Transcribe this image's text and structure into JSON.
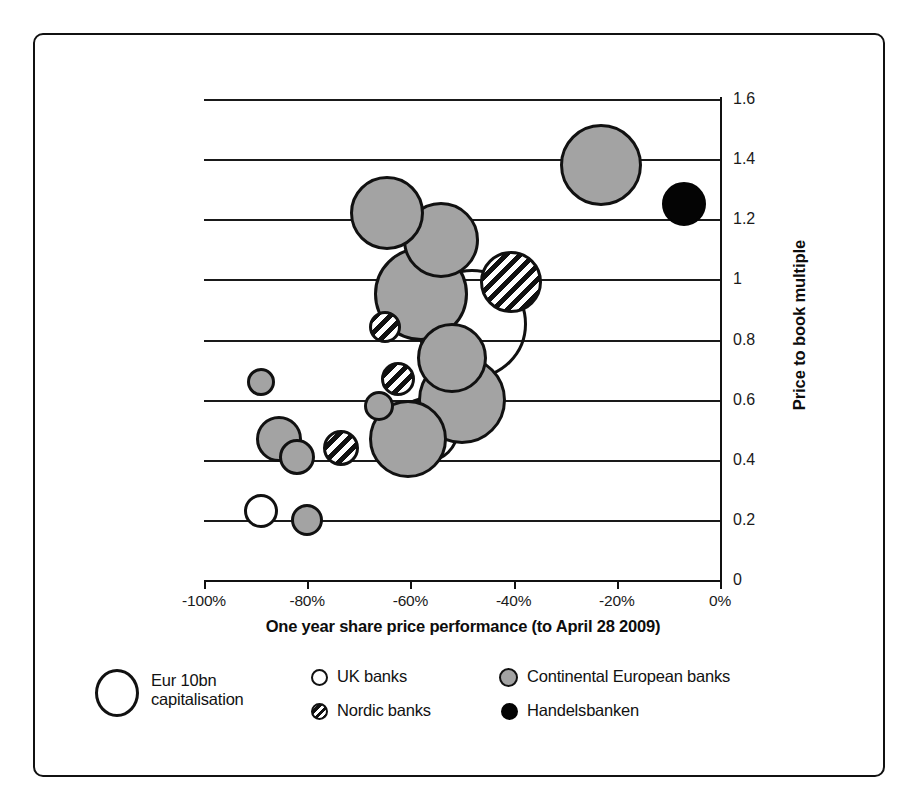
{
  "chart_data": {
    "type": "scatter",
    "title": "",
    "xlabel": "One year share price performance (to April 28 2009)",
    "ylabel": "Price to book multiple",
    "xlim": [
      -100,
      0
    ],
    "ylim": [
      0,
      1.6
    ],
    "xticks": [
      "-100%",
      "-80%",
      "-60%",
      "-40%",
      "-20%",
      "0%"
    ],
    "xtick_values": [
      -100,
      -80,
      -60,
      -40,
      -20,
      0
    ],
    "yticks": [
      "0",
      "0.2",
      "0.4",
      "0.6",
      "0.8",
      "1",
      "1.2",
      "1.4",
      "1.6"
    ],
    "ytick_values": [
      0,
      0.2,
      0.4,
      0.6,
      0.8,
      1,
      1.2,
      1.4,
      1.6
    ],
    "grid": "horizontal",
    "size_meaning": "bubble area proportional to market capitalisation",
    "series": [
      {
        "name": "Continental European banks",
        "style": "grey",
        "points": [
          {
            "x": -23.0,
            "y": 1.38,
            "r": 41
          },
          {
            "x": -64.5,
            "y": 1.22,
            "r": 37
          },
          {
            "x": -54.0,
            "y": 1.13,
            "r": 38
          },
          {
            "x": -58.0,
            "y": 0.95,
            "r": 47
          },
          {
            "x": -52.0,
            "y": 0.74,
            "r": 35
          },
          {
            "x": -50.0,
            "y": 0.6,
            "r": 44
          },
          {
            "x": -60.5,
            "y": 0.47,
            "r": 39
          },
          {
            "x": -66.0,
            "y": 0.58,
            "r": 15
          },
          {
            "x": -89.0,
            "y": 0.66,
            "r": 14
          },
          {
            "x": -85.5,
            "y": 0.47,
            "r": 23
          },
          {
            "x": -82.0,
            "y": 0.41,
            "r": 18
          },
          {
            "x": -80.0,
            "y": 0.2,
            "r": 16
          }
        ]
      },
      {
        "name": "Nordic banks",
        "style": "hatch",
        "points": [
          {
            "x": -40.5,
            "y": 0.99,
            "r": 31
          },
          {
            "x": -65.0,
            "y": 0.84,
            "r": 16
          },
          {
            "x": -62.5,
            "y": 0.67,
            "r": 17
          },
          {
            "x": -73.5,
            "y": 0.44,
            "r": 18
          }
        ]
      },
      {
        "name": "UK banks",
        "style": "white",
        "points": [
          {
            "x": -89.0,
            "y": 0.23,
            "r": 17
          },
          {
            "x": -48.0,
            "y": 0.85,
            "r": 55
          },
          {
            "x": -57.0,
            "y": 0.5,
            "r": 33
          }
        ]
      },
      {
        "name": "Handelsbanken",
        "style": "black",
        "points": [
          {
            "x": -7.0,
            "y": 1.25,
            "r": 22
          }
        ]
      }
    ]
  },
  "legend": {
    "entries": [
      {
        "label": "Eur 10bn\ncapitalisation",
        "swatch": "big-outline-circle"
      },
      {
        "label": "UK banks",
        "swatch": "white-circle"
      },
      {
        "label": "Nordic banks",
        "swatch": "hatched-circle"
      },
      {
        "label": "Continental European banks",
        "swatch": "grey-circle"
      },
      {
        "label": "Handelsbanken",
        "swatch": "black-circle"
      }
    ]
  },
  "colors": {
    "grey_fill": "#a3a3a3",
    "black_fill": "#040404",
    "white_fill": "#ffffff",
    "stroke": "#111111"
  }
}
